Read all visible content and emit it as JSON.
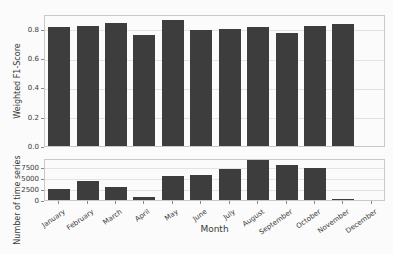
{
  "figure": {
    "background": "#fbfbfb",
    "bar_color": "#3d3d3d",
    "grid_color": "#e3e3e3",
    "spine_color": "#c9c9c9",
    "tick_color": "#888888",
    "text_color": "#3a3a3a",
    "xlabel": "Month"
  },
  "chart_data": [
    {
      "type": "bar",
      "title": "",
      "ylabel": "Weighted F1-Score",
      "xlabel": "",
      "categories": [
        "January",
        "February",
        "March",
        "April",
        "May",
        "June",
        "July",
        "August",
        "September",
        "October",
        "November",
        "December"
      ],
      "values": [
        0.81,
        0.82,
        0.84,
        0.76,
        0.86,
        0.79,
        0.8,
        0.81,
        0.77,
        0.82,
        0.83,
        0.0
      ],
      "ylim": [
        0,
        0.9
      ],
      "yticks": [
        {
          "value": 0.0,
          "label": "0.0"
        },
        {
          "value": 0.2,
          "label": "0.2"
        },
        {
          "value": 0.4,
          "label": "0.4"
        },
        {
          "value": 0.6,
          "label": "0.6"
        },
        {
          "value": 0.8,
          "label": "0.8"
        }
      ],
      "grid": true,
      "legend": "none",
      "show_xticklabels": false
    },
    {
      "type": "bar",
      "title": "",
      "ylabel": "Number of time series",
      "xlabel": "Month",
      "categories": [
        "January",
        "February",
        "March",
        "April",
        "May",
        "June",
        "July",
        "August",
        "September",
        "October",
        "November",
        "December"
      ],
      "values": [
        2400,
        4200,
        2900,
        600,
        5300,
        5700,
        7000,
        9000,
        7900,
        7300,
        250,
        0
      ],
      "ylim": [
        0,
        9450
      ],
      "yticks": [
        {
          "value": 0,
          "label": "0"
        },
        {
          "value": 2500,
          "label": "2500"
        },
        {
          "value": 5000,
          "label": "5000"
        },
        {
          "value": 7500,
          "label": "7500"
        }
      ],
      "grid": true,
      "legend": "none",
      "show_xticklabels": true
    }
  ]
}
